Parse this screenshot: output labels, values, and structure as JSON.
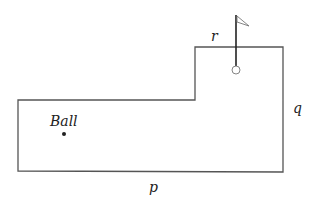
{
  "diagram": {
    "labels": {
      "ball": "Ball",
      "p": "p",
      "q": "q",
      "r": "r"
    },
    "colors": {
      "stroke": "#444444",
      "text": "#222222",
      "background": "#ffffff"
    },
    "elements": {
      "course_outline": "L-shaped golf green outline",
      "ball_marker": "ball",
      "flag": "flag on pole",
      "hole": "hole"
    }
  }
}
